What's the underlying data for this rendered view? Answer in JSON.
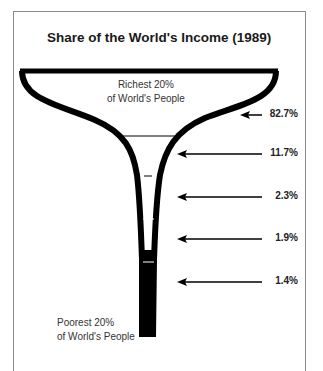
{
  "title": "Share of the World's Income (1989)",
  "top_label": [
    "Richest 20%",
    "of World's People"
  ],
  "bottom_label": [
    "Poorest 20%",
    "of World's People"
  ],
  "chart_data": {
    "type": "funnel",
    "title": "Share of the World's Income (1989)",
    "categories": [
      "Richest 20%",
      "Second 20%",
      "Third 20%",
      "Fourth 20%",
      "Poorest 20%"
    ],
    "values": [
      82.7,
      11.7,
      2.3,
      1.9,
      1.4
    ],
    "labels": [
      "82.7%",
      "11.7%",
      "2.3%",
      "1.9%",
      "1.4%"
    ],
    "unit": "% of world income",
    "top_annotation": "Richest 20% of World's People",
    "bottom_annotation": "Poorest 20% of World's People"
  }
}
